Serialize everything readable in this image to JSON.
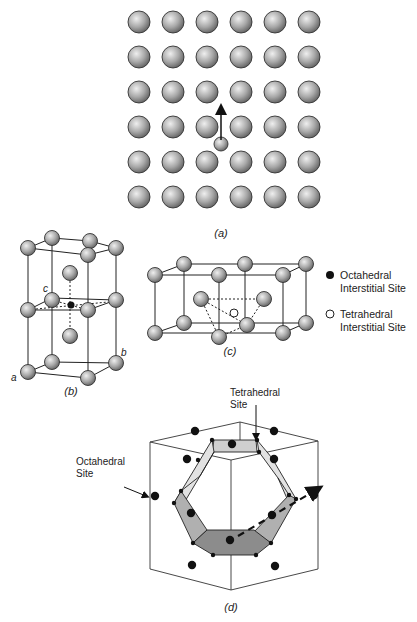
{
  "panels": {
    "a": {
      "caption": "(a)",
      "grid": {
        "rows": 6,
        "cols": 6,
        "x0": 139,
        "y0": 22,
        "dx": 34,
        "dy": 35,
        "r": 11
      },
      "interstitial": {
        "x": 221,
        "y": 144,
        "r": 7
      },
      "arrow": {
        "x": 221,
        "y1": 140,
        "y2": 109
      }
    },
    "b": {
      "caption": "(b)",
      "axis_labels": {
        "a": "a",
        "b": "b",
        "c": "c"
      }
    },
    "c": {
      "caption": "(c)"
    },
    "d": {
      "caption": "(d)",
      "label_tetrahedral": [
        "Tetrahedral",
        "Site"
      ],
      "label_octahedral": [
        "Octahedral",
        "Site"
      ]
    }
  },
  "legend": {
    "octahedral": [
      "Octahedral",
      "Interstitial Site"
    ],
    "tetrahedral": [
      "Tetrahedral",
      "Interstitial Site"
    ]
  },
  "colors": {
    "atom_fill_light": "#d9d9d9",
    "atom_fill_dark": "#7a7a7a",
    "atom_stroke": "#333333",
    "line": "#222222",
    "face_light": "#dcdcdc",
    "face_mid": "#b4b4b4",
    "face_dark": "#8e8e8e",
    "site_dot": "#111111"
  }
}
